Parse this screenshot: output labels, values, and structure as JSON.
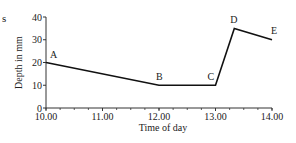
{
  "fragment_text": "s",
  "chart_data": {
    "type": "line",
    "title": "",
    "xlabel": "Time of day",
    "ylabel": "Depth in mm",
    "x_ticks": [
      10,
      11,
      12,
      13,
      14
    ],
    "x_tick_labels": [
      "10.00",
      "11.00",
      "12.00",
      "13.00",
      "14.00"
    ],
    "x_minor_step": 0.25,
    "y_ticks": [
      0,
      10,
      20,
      30,
      40
    ],
    "y_tick_labels": [
      "0",
      "10",
      "20",
      "30",
      "40"
    ],
    "xlim": [
      10,
      14
    ],
    "ylim": [
      0,
      40
    ],
    "grid": false,
    "series": [
      {
        "name": "Depth",
        "points": [
          {
            "label": "A",
            "x": 10.0,
            "y": 20
          },
          {
            "label": "B",
            "x": 12.0,
            "y": 10
          },
          {
            "label": "C",
            "x": 13.0,
            "y": 10
          },
          {
            "label": "D",
            "x": 13.333,
            "y": 35
          },
          {
            "label": "E",
            "x": 14.0,
            "y": 30
          }
        ]
      }
    ]
  }
}
